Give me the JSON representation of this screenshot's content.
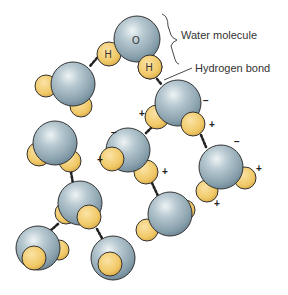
{
  "diagram": {
    "labels": {
      "water_molecule": "Water molecule",
      "hydrogen_bond": "Hydrogen bond",
      "oxygen": "O",
      "hydrogen": "H"
    },
    "signs": {
      "negative": "−",
      "positive": "+"
    },
    "colors": {
      "oxygen": "#9fb4bf",
      "oxygen_highlight": "#e8f0f3",
      "oxygen_shadow": "#6f8896",
      "hydrogen": "#f2cf7a",
      "hydrogen_shadow": "#d9a94a",
      "outline": "#2e2e2e",
      "bond": "#222222"
    },
    "molecule_count": 10
  }
}
